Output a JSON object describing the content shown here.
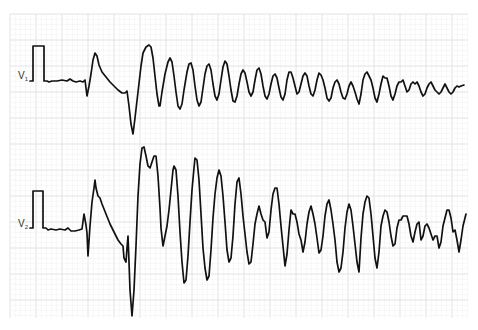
{
  "figure": {
    "grid": {
      "x0": 10,
      "y0": 14,
      "x1": 468,
      "y1": 318,
      "minor_spacing": 5.2,
      "major_every": 5,
      "minor_color": "#f1f1f1",
      "major_color": "#e2e2e2"
    },
    "trace_color": "#111111"
  },
  "leads": [
    {
      "name": "V",
      "subscript": "1",
      "label_x": 18,
      "label_y": 70,
      "calibration": {
        "x": 33,
        "x_end": 44,
        "top": 46,
        "baseline": 81
      },
      "points": "30,81 33,81 33,46 44,46 44,81 47,81 49,82 52,81 57,81 62,80 67,81 70,79 73,81 76,82 80,81 83,82 85,80 87,96 89,86 91,74 93,60 95,53 97,56 99,65 102,72 106,77 110,82 114,86 118,90 122,93 125,93 127,91 129,106 131,124 133,134 135,118 138,92 141,66 143,53 146,47 149,45 151,47 153,58 155,76 157,94 159,106 160,106 162,92 165,74 168,62 170,58 172,62 174,76 176,92 178,106 180,109 182,104 184,90 187,72 189,64 191,63 193,70 195,86 197,100 199,106 201,102 203,88 205,74 207,66 209,64 211,70 213,84 215,96 217,100 219,94 221,80 223,67 225,61 227,64 229,76 231,90 233,101 235,102 237,96 239,84 241,74 243,70 245,73 247,82 249,92 251,96 253,92 255,80 257,70 259,68 261,74 263,86 265,96 267,99 269,94 271,84 273,76 275,74 277,78 279,88 281,97 283,100 285,94 287,80 289,72 291,72 293,78 295,86 297,94 299,92 301,84 303,76 305,73 307,76 309,86 311,94 313,96 315,90 317,80 319,73 321,75 323,80 325,88 327,98 329,101 331,98 333,88 335,82 337,80 339,84 341,92 343,98 345,99 347,94 349,86 351,82 353,86 355,92 357,99 359,104 361,94 363,80 365,74 367,72 369,76 371,80 373,88 375,98 377,102 379,94 381,84 383,76 385,78 387,78 389,86 391,96 393,100 395,94 397,86 399,82 401,82 403,80 405,86 407,92 409,90 411,84 413,82 415,84 417,82 419,86 421,92 423,96 425,94 427,88 429,84 431,82 433,86 435,90 437,92 439,94 441,92 443,88 445,84 447,88 449,92 451,94 453,92 455,88 457,86 459,87 461,86 464,85"
    },
    {
      "name": "V",
      "subscript": "2",
      "label_x": 18,
      "label_y": 218,
      "calibration": {
        "x": 33,
        "x_end": 43,
        "top": 191,
        "baseline": 228
      },
      "points": "30,228 33,228 33,191 43,191 43,228 46,228 48,230 51,229 56,230 60,229 65,230 68,228 71,231 75,231 79,230 82,229 84,214 86,225 87,233 88,256 90,226 92,202 94,188 95,180 96,188 98,196 100,198 102,204 106,214 110,224 114,232 118,240 121,244 123,246 124,258 126,262 127,248 128,236 129,262 130,290 132,316 134,290 136,246 138,196 140,164 142,148 144,147 146,156 148,166 150,168 152,162 154,156 156,156 158,176 160,208 161,228 163,246 165,236 167,226 169,210 171,190 173,170 174,166 176,170 178,196 180,232 182,262 184,283 186,280 188,256 190,222 192,190 194,168 195,158 197,160 199,180 201,214 203,248 205,268 207,280 209,276 211,250 213,218 215,194 217,178 219,170 221,176 223,196 225,222 227,250 229,262 231,258 233,236 235,204 237,182 239,178 241,194 243,216 245,234 247,252 249,264 251,262 253,244 255,224 257,214 259,206 261,214 263,220 265,222 267,238 269,232 271,210 273,194 275,188 277,188 279,204 281,226 283,246 285,266 287,254 289,230 291,210 293,214 295,214 297,222 299,234 301,240 303,252 305,242 307,224 309,212 311,206 313,214 315,224 317,238 319,253 321,250 323,236 325,216 327,204 329,200 331,210 333,224 335,240 337,262 339,272 341,268 343,252 345,228 347,212 349,204 351,210 353,226 355,244 357,262 359,272 361,238 363,214 365,202 367,196 369,198 371,214 373,236 375,258 377,268 379,252 381,226 383,216 385,210 387,212 389,222 391,236 393,246 395,244 397,228 399,220 401,220 403,216 405,216 407,216 409,224 411,236 413,242 415,232 417,224 419,222 421,240 423,236 425,226 427,224 429,228 431,234 433,240 435,236 437,236 439,248 441,242 443,226 445,218 447,210 449,210 451,218 453,232 455,230 457,240 459,252 461,240 463,226 466,214"
    }
  ]
}
